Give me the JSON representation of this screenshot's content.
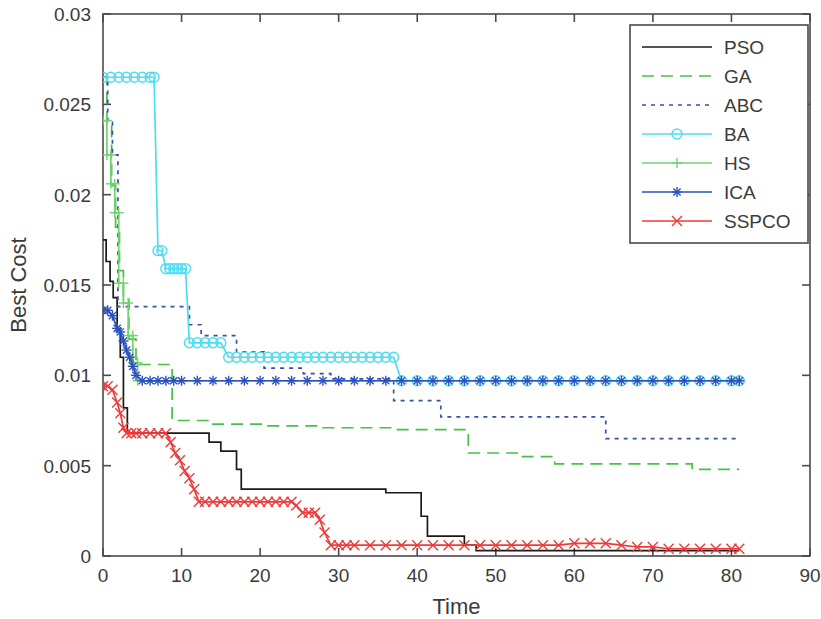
{
  "chart_data": {
    "type": "line",
    "title": "",
    "xlabel": "Time",
    "ylabel": "Best Cost",
    "xlim": [
      0,
      90
    ],
    "ylim": [
      0,
      0.03
    ],
    "xticks": [
      0,
      10,
      20,
      30,
      40,
      50,
      60,
      70,
      80,
      90
    ],
    "xtick_labels": [
      "0",
      "10",
      "20",
      "30",
      "40",
      "50",
      "60",
      "70",
      "80",
      "90"
    ],
    "yticks": [
      0,
      0.005,
      0.01,
      0.015,
      0.02,
      0.025,
      0.03
    ],
    "ytick_labels": [
      "0",
      "0.005",
      "0.01",
      "0.015",
      "0.02",
      "0.025",
      "0.03"
    ],
    "grid": false,
    "legend_position": "upper right",
    "series": [
      {
        "name": "PSO",
        "color": "#1a1a1a",
        "dash": "none",
        "marker": "none",
        "x": [
          0,
          0.4,
          0.4,
          0.9,
          0.9,
          1.3,
          1.3,
          1.8,
          1.8,
          2.2,
          2.2,
          2.6,
          2.6,
          3.1,
          3.1,
          13.5,
          13.5,
          15.0,
          15.0,
          17.0,
          17.0,
          17.6,
          17.6,
          36.0,
          36.0,
          40.5,
          40.5,
          41.3,
          41.3,
          46.0,
          46.0,
          47.5,
          47.5,
          81.0
        ],
        "y": [
          0.0175,
          0.0175,
          0.0163,
          0.0163,
          0.0152,
          0.0152,
          0.0143,
          0.0143,
          0.0125,
          0.0125,
          0.011,
          0.011,
          0.0082,
          0.0082,
          0.0068,
          0.0068,
          0.0063,
          0.0063,
          0.0058,
          0.0058,
          0.0048,
          0.0048,
          0.0037,
          0.0037,
          0.0035,
          0.0035,
          0.0022,
          0.0022,
          0.0011,
          0.0011,
          0.0006,
          0.0006,
          0.0003,
          0.0003
        ]
      },
      {
        "name": "GA",
        "color": "#48c048",
        "dash": "12,7",
        "marker": "none",
        "x": [
          0,
          0.5,
          0.5,
          1.1,
          1.1,
          1.6,
          1.6,
          2.1,
          2.1,
          2.6,
          2.6,
          3.3,
          3.3,
          4.2,
          4.2,
          8.8,
          8.8,
          14.0,
          14.0,
          21.0,
          21.0,
          28.0,
          28.0,
          37.0,
          37.0,
          46.5,
          46.5,
          53.0,
          53.0,
          57.5,
          57.5,
          75.0,
          75.0,
          81.0
        ],
        "y": [
          0.0265,
          0.0265,
          0.0241,
          0.0241,
          0.0205,
          0.0205,
          0.0182,
          0.0182,
          0.0158,
          0.0158,
          0.0142,
          0.0142,
          0.012,
          0.012,
          0.0106,
          0.0106,
          0.0075,
          0.0075,
          0.0073,
          0.0073,
          0.0072,
          0.0072,
          0.0071,
          0.0071,
          0.007,
          0.007,
          0.0057,
          0.0057,
          0.0055,
          0.0055,
          0.0051,
          0.0051,
          0.0048,
          0.0048
        ]
      },
      {
        "name": "ABC",
        "color": "#3a4fa8",
        "dash": "4,5",
        "marker": "none",
        "x": [
          0,
          0.6,
          0.6,
          1.2,
          1.2,
          1.9,
          1.9,
          11.0,
          11.0,
          12.5,
          12.5,
          17.0,
          17.0,
          20.5,
          20.5,
          25.5,
          25.5,
          29.0,
          29.0,
          37.0,
          37.0,
          43.0,
          43.0,
          64.0,
          64.0,
          81.0
        ],
        "y": [
          0.0265,
          0.0265,
          0.024,
          0.024,
          0.0222,
          0.0222,
          0.0138,
          0.0138,
          0.0128,
          0.0128,
          0.0122,
          0.0122,
          0.0113,
          0.0113,
          0.0104,
          0.0104,
          0.0101,
          0.0101,
          0.0098,
          0.0098,
          0.0086,
          0.0086,
          0.0077,
          0.0077,
          0.0065,
          0.0065
        ]
      },
      {
        "name": "BA",
        "color": "#4edcf0",
        "dash": "none",
        "marker": "circle",
        "x": [
          0,
          1,
          2,
          3,
          4,
          5,
          6,
          6.5,
          7,
          7.5,
          8,
          8.5,
          9,
          9.5,
          10,
          10.5,
          11,
          12,
          13,
          14,
          15,
          16,
          17,
          18,
          19,
          20,
          21,
          22,
          23,
          24,
          25,
          26,
          27,
          28,
          29,
          30,
          31,
          32,
          33,
          34,
          35,
          36,
          37,
          38,
          40,
          42,
          44,
          46,
          48,
          50,
          52,
          54,
          56,
          58,
          60,
          62,
          64,
          66,
          68,
          70,
          72,
          74,
          76,
          78,
          80,
          81
        ],
        "y": [
          0.0265,
          0.0265,
          0.0265,
          0.0265,
          0.0265,
          0.0265,
          0.0265,
          0.0265,
          0.0169,
          0.0169,
          0.0159,
          0.0159,
          0.0159,
          0.0159,
          0.0159,
          0.0159,
          0.0118,
          0.0118,
          0.0118,
          0.0118,
          0.0118,
          0.011,
          0.011,
          0.011,
          0.011,
          0.011,
          0.011,
          0.011,
          0.011,
          0.011,
          0.011,
          0.011,
          0.011,
          0.011,
          0.011,
          0.011,
          0.011,
          0.011,
          0.011,
          0.011,
          0.011,
          0.011,
          0.011,
          0.0097,
          0.0097,
          0.0097,
          0.0097,
          0.0097,
          0.0097,
          0.0097,
          0.0097,
          0.0097,
          0.0097,
          0.0097,
          0.0097,
          0.0097,
          0.0097,
          0.0097,
          0.0097,
          0.0097,
          0.0097,
          0.0097,
          0.0097,
          0.0097,
          0.0097,
          0.0097
        ]
      },
      {
        "name": "HS",
        "color": "#6fd46f",
        "dash": "none",
        "marker": "plus",
        "x": [
          0,
          0.5,
          0.5,
          1.0,
          1.0,
          1.5,
          1.5,
          2.0,
          2.0,
          2.6,
          2.6,
          3.2,
          3.2,
          3.8,
          3.8,
          4.4,
          4.4,
          81.0
        ],
        "y": [
          0.0241,
          0.0241,
          0.0222,
          0.0222,
          0.0206,
          0.0206,
          0.019,
          0.019,
          0.0151,
          0.0151,
          0.014,
          0.014,
          0.0122,
          0.0122,
          0.0107,
          0.0107,
          0.0097,
          0.0097
        ]
      },
      {
        "name": "ICA",
        "color": "#2a52be",
        "dash": "none",
        "marker": "star",
        "x": [
          0,
          0.6,
          1.2,
          1.8,
          2.2,
          2.6,
          3.0,
          3.4,
          3.8,
          4.2,
          5,
          6,
          7,
          8,
          9,
          10,
          12,
          14,
          16,
          18,
          20,
          22,
          24,
          26,
          28,
          30,
          32,
          34,
          36,
          38,
          40,
          42,
          44,
          46,
          48,
          50,
          52,
          54,
          56,
          58,
          60,
          62,
          64,
          66,
          68,
          70,
          72,
          74,
          76,
          78,
          80,
          81
        ],
        "y": [
          0.0136,
          0.0136,
          0.0133,
          0.0126,
          0.0124,
          0.0119,
          0.0114,
          0.011,
          0.0105,
          0.01,
          0.0097,
          0.0097,
          0.0097,
          0.0097,
          0.0097,
          0.0097,
          0.0097,
          0.0097,
          0.0097,
          0.0097,
          0.0097,
          0.0097,
          0.0097,
          0.0097,
          0.0097,
          0.0097,
          0.0097,
          0.0097,
          0.0097,
          0.0097,
          0.0097,
          0.0097,
          0.0097,
          0.0097,
          0.0097,
          0.0097,
          0.0097,
          0.0097,
          0.0097,
          0.0097,
          0.0097,
          0.0097,
          0.0097,
          0.0097,
          0.0097,
          0.0097,
          0.0097,
          0.0097,
          0.0097,
          0.0097,
          0.0097,
          0.0097
        ]
      },
      {
        "name": "SSPCO",
        "color": "#ef3a3a",
        "dash": "none",
        "marker": "cross",
        "x": [
          0,
          0.6,
          1.2,
          1.8,
          2.2,
          2.6,
          3.0,
          3.6,
          4.2,
          5,
          6,
          7,
          8,
          8.6,
          9.2,
          9.8,
          10.4,
          11,
          11.6,
          12.2,
          13,
          14,
          15,
          16,
          17,
          18,
          19,
          20,
          21,
          22,
          23,
          24,
          24.6,
          25.4,
          26.2,
          27,
          27.6,
          28.2,
          29,
          30,
          31,
          32,
          34,
          36,
          38,
          40,
          42,
          44,
          46,
          48,
          50,
          52,
          54,
          56,
          58,
          60,
          62,
          64,
          66,
          68,
          70,
          72,
          74,
          76,
          78,
          80,
          81
        ],
        "y": [
          0.0094,
          0.0094,
          0.0092,
          0.0085,
          0.0079,
          0.0071,
          0.0068,
          0.0068,
          0.0068,
          0.0068,
          0.0068,
          0.0068,
          0.0068,
          0.0063,
          0.0057,
          0.0053,
          0.0047,
          0.0043,
          0.0037,
          0.003,
          0.003,
          0.003,
          0.003,
          0.003,
          0.003,
          0.003,
          0.003,
          0.003,
          0.003,
          0.003,
          0.003,
          0.003,
          0.0028,
          0.0024,
          0.0024,
          0.0024,
          0.002,
          0.0013,
          0.0006,
          0.0006,
          0.0006,
          0.0006,
          0.0006,
          0.0006,
          0.0006,
          0.0006,
          0.0006,
          0.0006,
          0.0006,
          0.0006,
          0.0006,
          0.0006,
          0.0006,
          0.0006,
          0.0006,
          0.0007,
          0.0007,
          0.0007,
          0.0006,
          0.0005,
          0.0005,
          0.0004,
          0.0004,
          0.0004,
          0.0004,
          0.0004,
          0.0004
        ]
      }
    ],
    "legend_entries": [
      {
        "label": "PSO",
        "color": "#1a1a1a",
        "dash": "none",
        "marker": "none"
      },
      {
        "label": "GA",
        "color": "#48c048",
        "dash": "12,7",
        "marker": "none"
      },
      {
        "label": "ABC",
        "color": "#3a4fa8",
        "dash": "4,5",
        "marker": "none"
      },
      {
        "label": "BA",
        "color": "#4edcf0",
        "dash": "none",
        "marker": "circle"
      },
      {
        "label": "HS",
        "color": "#6fd46f",
        "dash": "none",
        "marker": "plus"
      },
      {
        "label": "ICA",
        "color": "#2a52be",
        "dash": "none",
        "marker": "star"
      },
      {
        "label": "SSPCO",
        "color": "#ef3a3a",
        "dash": "none",
        "marker": "cross"
      }
    ]
  }
}
